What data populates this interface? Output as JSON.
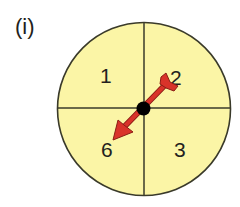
{
  "figure": {
    "label": "(i)",
    "spinner": {
      "fill_color": "#fbf5a6",
      "outline_color": "#3a3a2a",
      "sectors": [
        {
          "position": "top-left",
          "value": "1"
        },
        {
          "position": "top-right",
          "value": "2"
        },
        {
          "position": "bottom-right",
          "value": "3"
        },
        {
          "position": "bottom-left",
          "value": "6"
        }
      ],
      "arrow": {
        "color": "#d9332a",
        "outline_color": "#8a1c14",
        "points_to": "6"
      },
      "pivot_color": "#000000"
    }
  }
}
